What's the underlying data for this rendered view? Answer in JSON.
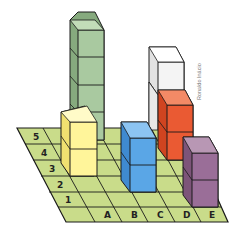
{
  "diagram": {
    "credit": "Ronaldo Inácio",
    "row_labels": [
      "5",
      "4",
      "3",
      "2",
      "1"
    ],
    "column_labels": [
      "A",
      "B",
      "C",
      "D",
      "E"
    ],
    "grid_color": "#c9dc8a",
    "line_color": "#1a1a1a",
    "stacks": [
      {
        "name": "green-stack",
        "color": "#a9c9a0",
        "side": "#86aa7e",
        "top": "#c2dcb8",
        "cubes": 4
      },
      {
        "name": "yellow-stack",
        "color": "#fff59a",
        "side": "#f0e070",
        "top": "#fffbc8",
        "cubes": 2
      },
      {
        "name": "blue-stack",
        "color": "#5aa6e6",
        "side": "#3f8ad0",
        "top": "#8cc4f2",
        "cubes": 2
      },
      {
        "name": "white-stack",
        "color": "#f4f4f4",
        "side": "#e2e2e2",
        "top": "#ffffff",
        "cubes": 1
      },
      {
        "name": "red-stack",
        "color": "#ea5a33",
        "side": "#d04420",
        "top": "#f38a66",
        "cubes": 2
      },
      {
        "name": "purple-stack",
        "color": "#9a6e98",
        "side": "#7d5479",
        "top": "#b897b4",
        "cubes": 2
      }
    ]
  }
}
